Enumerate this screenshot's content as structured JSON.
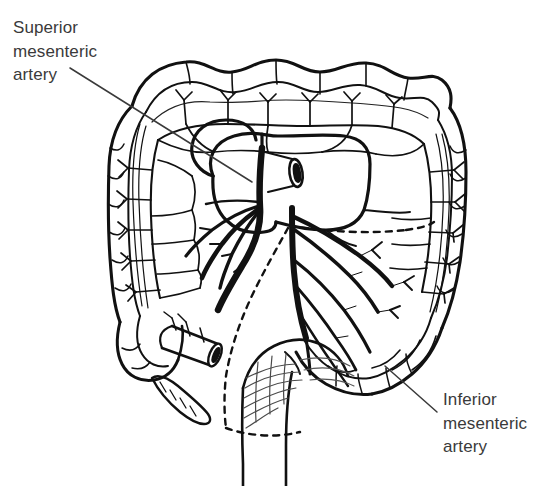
{
  "figure": {
    "type": "anatomical-line-drawing",
    "background_color": "#ffffff",
    "ink_color": "#111111",
    "label_color": "#3a3a3a",
    "width": 534,
    "height": 486
  },
  "labels": {
    "superior_mesenteric_artery": "Superior\nmesenteric\nartery",
    "inferior_mesenteric_artery": "Inferior\nmesenteric\nartery"
  },
  "leader_lines": {
    "sma": {
      "x1": 70,
      "y1": 68,
      "x2": 252,
      "y2": 182
    },
    "ima": {
      "x1": 437,
      "y1": 412,
      "x2": 385,
      "y2": 368
    }
  },
  "structures": [
    {
      "name": "transverse-colon",
      "region": "top"
    },
    {
      "name": "ascending-colon",
      "region": "left"
    },
    {
      "name": "descending-colon",
      "region": "right"
    },
    {
      "name": "cecum",
      "region": "lower-left"
    },
    {
      "name": "appendix",
      "region": "lower-left"
    },
    {
      "name": "terminal-ileum-stump",
      "region": "lower-left"
    },
    {
      "name": "sigmoid-colon",
      "region": "lower-right"
    },
    {
      "name": "rectum",
      "region": "bottom-center"
    },
    {
      "name": "small-bowel-mesentery",
      "region": "center"
    },
    {
      "name": "aorta-stump",
      "region": "center"
    },
    {
      "name": "superior-mesenteric-artery-trunk",
      "region": "center"
    },
    {
      "name": "inferior-mesenteric-artery-trunk",
      "region": "center-right"
    },
    {
      "name": "marginal-artery-arcade",
      "region": "perimeter"
    },
    {
      "name": "vasa-recta",
      "region": "perimeter"
    },
    {
      "name": "watershed-dashed-line",
      "region": "center"
    }
  ]
}
